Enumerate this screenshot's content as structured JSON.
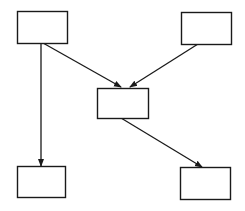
{
  "diagram": {
    "width": 245,
    "height": 211,
    "background": "#ffffff",
    "stroke_color": "#1a1a1a",
    "nodes": [
      {
        "id": "top-left",
        "label": "",
        "x": 17,
        "y": 11,
        "w": 50,
        "h": 32
      },
      {
        "id": "top-right",
        "label": "",
        "x": 181,
        "y": 12,
        "w": 50,
        "h": 32
      },
      {
        "id": "middle",
        "label": "",
        "x": 97,
        "y": 88,
        "w": 51,
        "h": 30
      },
      {
        "id": "bottom-left",
        "label": "",
        "x": 17,
        "y": 166,
        "w": 48,
        "h": 31
      },
      {
        "id": "bottom-right",
        "label": "",
        "x": 180,
        "y": 167,
        "w": 50,
        "h": 32
      }
    ],
    "edges": [
      {
        "from": "top-left",
        "to": "bottom-left",
        "x1": 41,
        "y1": 43,
        "x2": 41,
        "y2": 166
      },
      {
        "from": "top-left",
        "to": "middle",
        "x1": 43,
        "y1": 43,
        "x2": 121,
        "y2": 87
      },
      {
        "from": "top-right",
        "to": "middle",
        "x1": 198,
        "y1": 44,
        "x2": 130,
        "y2": 87
      },
      {
        "from": "middle",
        "to": "bottom-right",
        "x1": 121,
        "y1": 118,
        "x2": 202,
        "y2": 167
      }
    ]
  }
}
